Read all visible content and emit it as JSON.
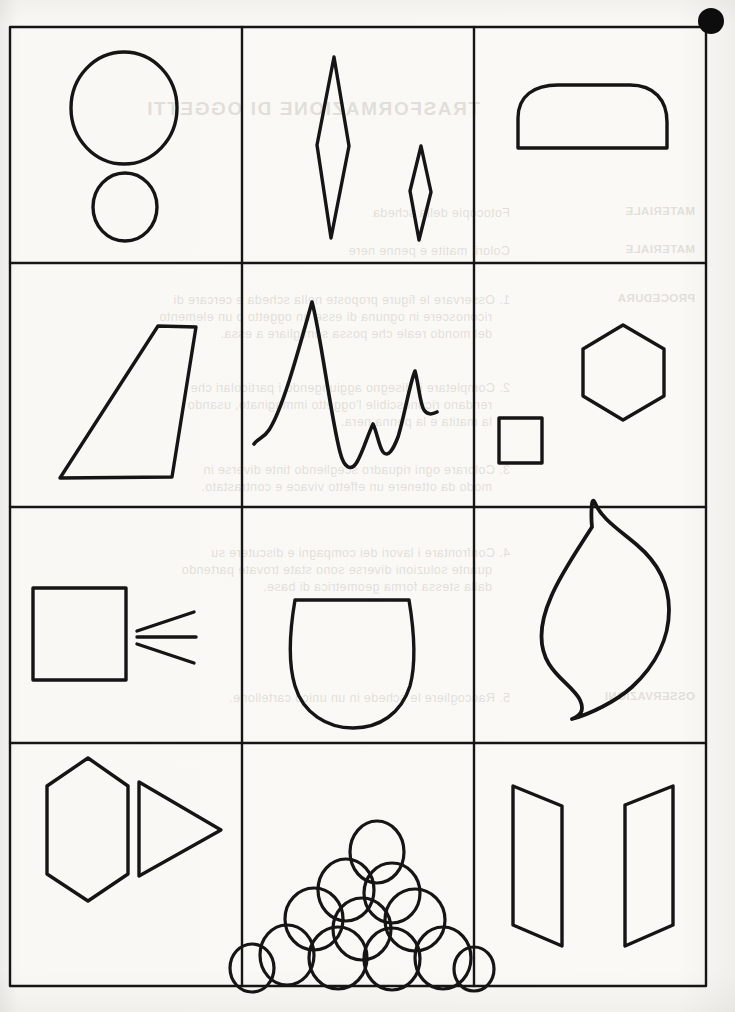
{
  "page": {
    "width": 735,
    "height": 1012,
    "background": "#fbfaf8",
    "ink": "#111111",
    "grid": {
      "left": 10,
      "right": 706,
      "top": 27,
      "bottom": 986,
      "columns_x": [
        10,
        242,
        474,
        706
      ],
      "rows_y": [
        27,
        263,
        507,
        743,
        986
      ],
      "stroke": "#151515",
      "stroke_width": 2.2
    },
    "corner_marker": {
      "name": "black-dot",
      "cx": 711,
      "cy": 21,
      "r": 13,
      "color": "#0d0d0d"
    }
  },
  "ghost_text": {
    "note": "faint mirrored bleed-through from the reverse page",
    "title": "TRASFORMAZIONE DI OGGETTI",
    "lines": [
      {
        "text": "MATERIALE",
        "x": 40,
        "y": 205,
        "cls": "lbl"
      },
      {
        "text": "MATERIALE",
        "x": 40,
        "y": 243,
        "cls": "lbl"
      },
      {
        "text": "Fotocopie della scheda",
        "x": 225,
        "y": 205,
        "cls": "body"
      },
      {
        "text": "Colori, matite e penne nere",
        "x": 225,
        "y": 243,
        "cls": "body"
      },
      {
        "text": "PROCEDURA",
        "x": 40,
        "y": 292,
        "cls": "lbl"
      },
      {
        "text": "1. Osservare le figure proposte nella scheda e cercare di",
        "x": 225,
        "y": 292,
        "cls": "body"
      },
      {
        "text": "riconoscere in ognuna di esse un oggetto o un elemento",
        "x": 243,
        "y": 309,
        "cls": "body"
      },
      {
        "text": "del mondo reale che possa somigliare a essa.",
        "x": 243,
        "y": 326,
        "cls": "body"
      },
      {
        "text": "2. Completare il disegno aggiungendo i particolari che",
        "x": 225,
        "y": 380,
        "cls": "body"
      },
      {
        "text": "rendano riconoscibile l'oggetto immaginato, usando",
        "x": 243,
        "y": 397,
        "cls": "body"
      },
      {
        "text": "la matita e la penna nera.",
        "x": 243,
        "y": 414,
        "cls": "body"
      },
      {
        "text": "3. Colorare ogni riquadro scegliendo tinte diverse in",
        "x": 225,
        "y": 462,
        "cls": "body"
      },
      {
        "text": "modo da ottenere un effetto vivace e contrastato.",
        "x": 243,
        "y": 479,
        "cls": "body"
      },
      {
        "text": "4. Confrontare i lavori dei compagni e discutere su",
        "x": 225,
        "y": 545,
        "cls": "body"
      },
      {
        "text": "quante soluzioni diverse sono state trovate partendo",
        "x": 243,
        "y": 562,
        "cls": "body"
      },
      {
        "text": "dalla stessa forma geometrica di base.",
        "x": 243,
        "y": 579,
        "cls": "body"
      },
      {
        "text": "OSSERVAZIONI",
        "x": 40,
        "y": 690,
        "cls": "lbl"
      },
      {
        "text": "5. Raccogliere le schede in un unico cartellone.",
        "x": 225,
        "y": 690,
        "cls": "body"
      }
    ]
  },
  "cells": [
    {
      "id": "cell-1-1",
      "row": 1,
      "column": 1,
      "name": "two-circles",
      "shapes": [
        "large-circle",
        "small-circle"
      ],
      "description": "A large circle above a smaller circle"
    },
    {
      "id": "cell-1-2",
      "row": 1,
      "column": 2,
      "name": "two-rhombuses",
      "shapes": [
        "large-rhombus",
        "small-rhombus"
      ],
      "description": "A tall narrow rhombus beside a small narrow rhombus"
    },
    {
      "id": "cell-1-3",
      "row": 1,
      "column": 3,
      "name": "rounded-dome",
      "shapes": [
        "dome"
      ],
      "description": "A dome with flat base and rounded top corners"
    },
    {
      "id": "cell-2-1",
      "row": 2,
      "column": 1,
      "name": "trapezoid",
      "shapes": [
        "right-trapezoid"
      ],
      "description": "A slanted quadrilateral, narrow at top, wide at bottom"
    },
    {
      "id": "cell-2-2",
      "row": 2,
      "column": 2,
      "name": "wavy-peaks-curve",
      "shapes": [
        "open-wave-line"
      ],
      "description": "An open curved line with one tall peak and two smaller peaks"
    },
    {
      "id": "cell-2-3",
      "row": 2,
      "column": 3,
      "name": "square-and-hexagon",
      "shapes": [
        "small-square",
        "hexagon"
      ],
      "description": "A small square at lower left and a regular hexagon at upper right"
    },
    {
      "id": "cell-3-1",
      "row": 3,
      "column": 1,
      "name": "square-with-rays",
      "shapes": [
        "square",
        "ray-top",
        "ray-middle",
        "ray-bottom"
      ],
      "description": "A square with three short diverging lines to its right"
    },
    {
      "id": "cell-3-2",
      "row": 3,
      "column": 2,
      "name": "bowl-shape",
      "shapes": [
        "u-bowl"
      ],
      "description": "A rounded bowl / inverted dome with a flat top edge"
    },
    {
      "id": "cell-3-3",
      "row": 3,
      "column": 3,
      "name": "flame-s-curve",
      "shapes": [
        "flame"
      ],
      "description": "An S-shaped flame or wave form with pointed tips"
    },
    {
      "id": "cell-4-1",
      "row": 4,
      "column": 1,
      "name": "hexagon-and-triangle",
      "shapes": [
        "tall-hexagon",
        "right-triangle-pointer"
      ],
      "description": "An elongated vertical hexagon next to a right-pointing triangle"
    },
    {
      "id": "cell-4-2",
      "row": 4,
      "column": 2,
      "name": "stack-of-ovals",
      "shapes": [
        "oval-pile"
      ],
      "count": 13,
      "description": "A pyramid-shaped pile of overlapping ovals"
    },
    {
      "id": "cell-4-3",
      "row": 4,
      "column": 3,
      "name": "two-panels",
      "shapes": [
        "left-panel",
        "right-panel"
      ],
      "description": "Two mirrored trapezoidal panels like open doors in perspective"
    }
  ]
}
